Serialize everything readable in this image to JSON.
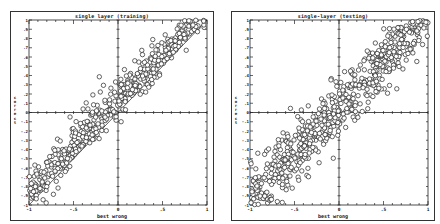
{
  "chart_data": [
    {
      "type": "scatter",
      "title": "single layer (training)",
      "xlabel": "best wrong",
      "ylabel": "correct",
      "xlim": [
        -1,
        1
      ],
      "ylim": [
        -1,
        1
      ],
      "x_ticks": [
        "-1",
        "-.5",
        "0",
        ".5",
        "1"
      ],
      "y_ticks": [
        "-1",
        "-.9",
        "-.8",
        "-.7",
        "-.6",
        "-.5",
        "-.4",
        "-.3",
        "-.2",
        "-.1",
        "0",
        ".1",
        ".2",
        ".3",
        ".4",
        ".5",
        ".6",
        ".7",
        ".8",
        ".9",
        "1"
      ],
      "grid": false,
      "reference_line": "y = x",
      "marker": "open circle",
      "description": "Dense band of points along and above diagonal from (-1,-1) to (1,1); most points above y=x"
    },
    {
      "type": "scatter",
      "title": "single-layer (testing)",
      "xlabel": "best wrong",
      "ylabel": "correct",
      "xlim": [
        -1,
        1
      ],
      "ylim": [
        -1,
        1
      ],
      "x_ticks": [
        "-1",
        "-.5",
        "0",
        ".5",
        "1"
      ],
      "y_ticks": [
        "-1",
        "-.9",
        "-.8",
        "-.7",
        "-.6",
        "-.5",
        "-.4",
        "-.3",
        "-.2",
        "-.1",
        "0",
        ".1",
        ".2",
        ".3",
        ".4",
        ".5",
        ".6",
        ".7",
        ".8",
        ".9",
        "1"
      ],
      "grid": false,
      "marker": "open circle",
      "description": "Broader band of points along diagonal from (-1,-1) to (1,1), more spread on both sides"
    }
  ],
  "panels": [
    {
      "title": "single layer (training)",
      "xlabel": "best wrong",
      "ylabel": "correct"
    },
    {
      "title": "single-layer (testing)",
      "xlabel": "best wrong",
      "ylabel": "correct"
    }
  ]
}
